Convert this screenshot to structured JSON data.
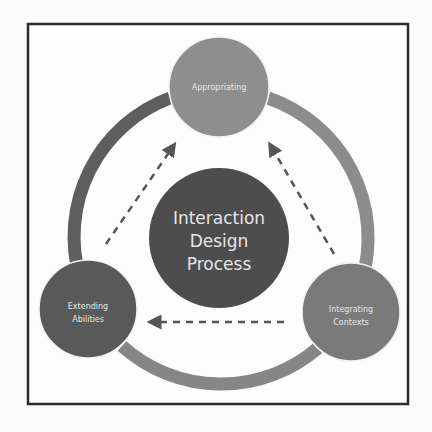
{
  "diagram": {
    "center": {
      "lines": [
        "Interaction",
        "Design",
        "Process"
      ],
      "color": "#4d4d4d"
    },
    "nodes": [
      {
        "id": "appropriating",
        "lines": [
          "Appropriating"
        ],
        "color": "#8e8e8e"
      },
      {
        "id": "extending-abilities",
        "lines": [
          "Extending",
          "Abilities"
        ],
        "color": "#595959"
      },
      {
        "id": "integrating-contexts",
        "lines": [
          "Integrating",
          "Contexts"
        ],
        "color": "#7a7a7a"
      }
    ],
    "arrows": [
      {
        "from": "extending-abilities",
        "to": "appropriating",
        "style": "dashed"
      },
      {
        "from": "integrating-contexts",
        "to": "appropriating",
        "style": "dashed"
      },
      {
        "from": "integrating-contexts",
        "to": "extending-abilities",
        "style": "dashed"
      }
    ],
    "ring_colors": {
      "left": "#5e5e5e",
      "right": "#8c8c8c",
      "bottom": "#868686"
    },
    "frame_color": "#2a2a2a",
    "arrow_color": "#555555"
  }
}
